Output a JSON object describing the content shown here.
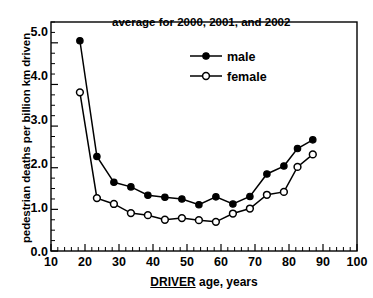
{
  "chart_data": {
    "type": "line",
    "title": "",
    "annotation": "average for 2000, 2001, and 2002",
    "xlabel_underlined": "DRIVER",
    "xlabel_rest": " age, years",
    "xlabel": "DRIVER age, years",
    "ylabel": "pedestrian deaths per billion km driven",
    "xlim": [
      10,
      100
    ],
    "ylim": [
      0.0,
      5.5
    ],
    "grid": false,
    "legend_position": "upper-center-inside",
    "x_major_ticks": [
      10,
      20,
      30,
      40,
      50,
      60,
      70,
      80,
      90,
      100
    ],
    "x_major_tick_labels": [
      "10",
      "20",
      "30",
      "40",
      "50",
      "60",
      "70",
      "80",
      "90",
      "100"
    ],
    "x_minor_tick_step": 2,
    "y_major_ticks": [
      0.0,
      1.0,
      2.0,
      3.0,
      4.0,
      5.0
    ],
    "y_major_tick_labels": [
      "0.0",
      "1.0",
      "2.0",
      "3.0",
      "4.0",
      "5.0"
    ],
    "y_minor_tick_step": 0.25,
    "x": [
      18.5,
      23.5,
      28.5,
      33.5,
      38.5,
      43.5,
      48.5,
      53.5,
      58.5,
      63.5,
      68.5,
      73.5,
      78.5,
      82.5,
      87.0
    ],
    "series": [
      {
        "name": "male",
        "marker": "filled-circle",
        "values": [
          5.05,
          2.27,
          1.65,
          1.54,
          1.34,
          1.29,
          1.25,
          1.11,
          1.3,
          1.13,
          1.31,
          1.85,
          2.04,
          2.46,
          2.67
        ]
      },
      {
        "name": "female",
        "marker": "open-circle",
        "values": [
          3.81,
          1.27,
          1.13,
          0.91,
          0.86,
          0.75,
          0.79,
          0.74,
          0.7,
          0.9,
          1.02,
          1.35,
          1.42,
          2.02,
          2.32
        ]
      }
    ]
  },
  "legend": {
    "male_label": "male",
    "female_label": "female"
  },
  "colors": {
    "axis": "#000000",
    "male": "#000000",
    "female": "#000000",
    "background": "#ffffff"
  }
}
